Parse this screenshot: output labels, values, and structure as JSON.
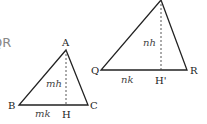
{
  "fragment_text": "QR",
  "triangle_small": {
    "vertices": {
      "apex": "A",
      "left": "B",
      "right": "C",
      "foot": "H"
    },
    "height_label": "mh",
    "base_label": "mk"
  },
  "triangle_large": {
    "vertices": {
      "left": "Q",
      "right": "R",
      "foot": "H'"
    },
    "height_label": "nh",
    "base_label": "nk"
  },
  "colors": {
    "stroke": "#222222",
    "text": "#222222",
    "fragment": "#888888"
  }
}
